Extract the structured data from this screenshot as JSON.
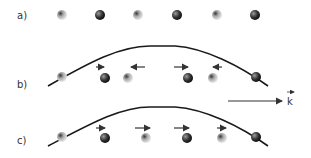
{
  "panels": [
    {
      "label": "a)",
      "description": "equilibrium positions"
    },
    {
      "label": "b)",
      "description": "transverse-like standing wave: atoms displaced alternately"
    },
    {
      "label": "c)",
      "description": "atoms displaced in same direction"
    }
  ],
  "wave_vector_label": "k",
  "colors": {
    "curve": "#1a1a1a",
    "dark_atom": "#2a2a2a",
    "light_atom": "#9a9a9a",
    "arrow": "#333333"
  }
}
